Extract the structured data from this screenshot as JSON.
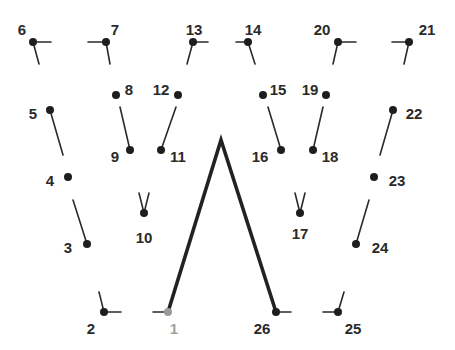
{
  "puzzle": {
    "type": "connect-the-dots",
    "colors": {
      "dot": "#1e1e1e",
      "first_dot": "#9a9a9a",
      "line": "#222222",
      "label": "#2a2a2a",
      "first_label": "#a0a0a0"
    },
    "drawn_path": [
      [
        168,
        312
      ],
      [
        221,
        140
      ],
      [
        276,
        312
      ]
    ],
    "dots": [
      {
        "n": "1",
        "x": 168,
        "y": 312,
        "lx": 174,
        "ly": 330,
        "first": true
      },
      {
        "n": "2",
        "x": 104,
        "y": 312,
        "lx": 91,
        "ly": 330
      },
      {
        "n": "3",
        "x": 87,
        "y": 244,
        "lx": 68,
        "ly": 249
      },
      {
        "n": "4",
        "x": 68,
        "y": 177,
        "lx": 50,
        "ly": 182
      },
      {
        "n": "5",
        "x": 50,
        "y": 110,
        "lx": 33,
        "ly": 115
      },
      {
        "n": "6",
        "x": 33,
        "y": 42,
        "lx": 22,
        "ly": 31
      },
      {
        "n": "7",
        "x": 106,
        "y": 42,
        "lx": 115,
        "ly": 31
      },
      {
        "n": "8",
        "x": 116,
        "y": 95,
        "lx": 129,
        "ly": 91
      },
      {
        "n": "9",
        "x": 130,
        "y": 150,
        "lx": 115,
        "ly": 158
      },
      {
        "n": "10",
        "x": 144,
        "y": 213,
        "lx": 144,
        "ly": 239
      },
      {
        "n": "11",
        "x": 161,
        "y": 150,
        "lx": 178,
        "ly": 158
      },
      {
        "n": "12",
        "x": 178,
        "y": 95,
        "lx": 161,
        "ly": 91
      },
      {
        "n": "13",
        "x": 193,
        "y": 42,
        "lx": 194,
        "ly": 31
      },
      {
        "n": "14",
        "x": 248,
        "y": 42,
        "lx": 253,
        "ly": 31
      },
      {
        "n": "15",
        "x": 263,
        "y": 95,
        "lx": 278,
        "ly": 91
      },
      {
        "n": "16",
        "x": 281,
        "y": 150,
        "lx": 260,
        "ly": 158
      },
      {
        "n": "17",
        "x": 300,
        "y": 213,
        "lx": 300,
        "ly": 235
      },
      {
        "n": "18",
        "x": 313,
        "y": 150,
        "lx": 330,
        "ly": 158
      },
      {
        "n": "19",
        "x": 326,
        "y": 95,
        "lx": 310,
        "ly": 91
      },
      {
        "n": "20",
        "x": 338,
        "y": 42,
        "lx": 322,
        "ly": 31
      },
      {
        "n": "21",
        "x": 409,
        "y": 42,
        "lx": 427,
        "ly": 31
      },
      {
        "n": "22",
        "x": 393,
        "y": 110,
        "lx": 414,
        "ly": 115
      },
      {
        "n": "23",
        "x": 374,
        "y": 177,
        "lx": 397,
        "ly": 182
      },
      {
        "n": "24",
        "x": 356,
        "y": 244,
        "lx": 380,
        "ly": 249
      },
      {
        "n": "25",
        "x": 338,
        "y": 312,
        "lx": 353,
        "ly": 330
      },
      {
        "n": "26",
        "x": 276,
        "y": 312,
        "lx": 262,
        "ly": 330
      }
    ],
    "hints": [
      [
        33,
        42,
        51,
        42
      ],
      [
        33,
        42,
        39,
        64
      ],
      [
        106,
        42,
        88,
        42
      ],
      [
        106,
        42,
        110,
        64
      ],
      [
        193,
        42,
        208,
        42
      ],
      [
        193,
        42,
        187,
        64
      ],
      [
        248,
        42,
        236,
        42
      ],
      [
        248,
        42,
        255,
        64
      ],
      [
        338,
        42,
        356,
        42
      ],
      [
        338,
        42,
        333,
        64
      ],
      [
        409,
        42,
        392,
        42
      ],
      [
        409,
        42,
        404,
        64
      ],
      [
        50,
        110,
        63,
        155
      ],
      [
        73,
        200,
        87,
        244
      ],
      [
        120,
        107,
        130,
        150
      ],
      [
        176,
        107,
        161,
        150
      ],
      [
        144,
        213,
        139,
        193
      ],
      [
        144,
        213,
        149,
        193
      ],
      [
        268,
        107,
        281,
        150
      ],
      [
        323,
        107,
        313,
        150
      ],
      [
        300,
        213,
        295,
        193
      ],
      [
        300,
        213,
        305,
        193
      ],
      [
        393,
        110,
        380,
        155
      ],
      [
        369,
        200,
        356,
        244
      ],
      [
        104,
        312,
        99,
        292
      ],
      [
        104,
        312,
        121,
        312
      ],
      [
        168,
        312,
        153,
        312
      ],
      [
        276,
        312,
        291,
        312
      ],
      [
        338,
        312,
        344,
        292
      ],
      [
        338,
        312,
        323,
        312
      ]
    ]
  }
}
